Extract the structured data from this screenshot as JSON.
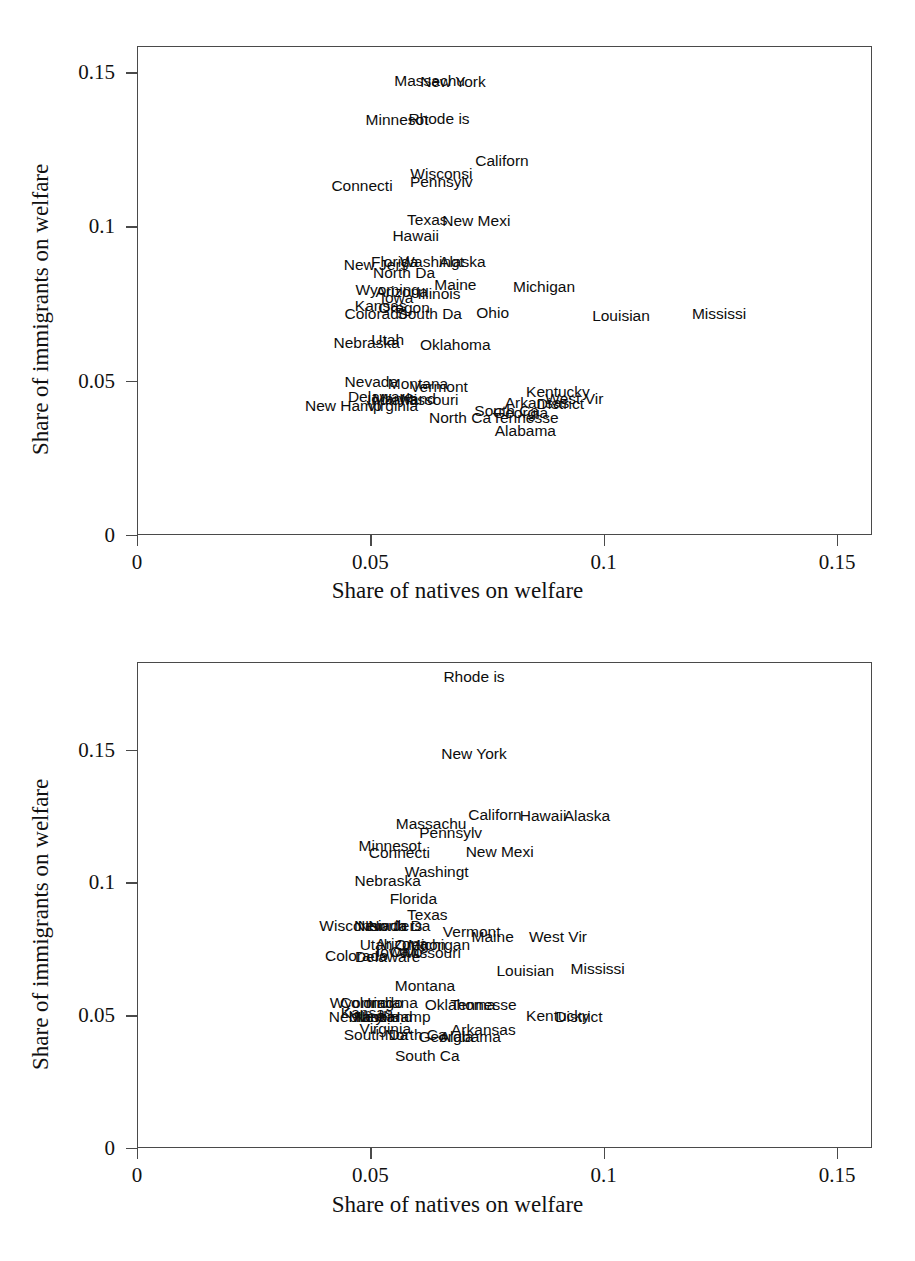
{
  "chart_data": [
    {
      "type": "scatter",
      "id": "chart-top",
      "title": "",
      "xlabel": "Share of natives on welfare",
      "ylabel": "Share of immigrants on welfare",
      "xlim": [
        0,
        0.1575
      ],
      "ylim": [
        0,
        0.1585
      ],
      "xticks": [
        0,
        0.05,
        0.1,
        0.15
      ],
      "xticklabels": [
        "0",
        "0.05",
        "0.1",
        "0.15"
      ],
      "yticks": [
        0,
        0.05,
        0.1,
        0.15
      ],
      "yticklabels": [
        "0",
        "0.05",
        "0.1",
        "0.15"
      ],
      "grid": false,
      "legend": "none",
      "marker": "text-label",
      "points": [
        {
          "label": "Massachu",
          "x": 0.0625,
          "y": 0.1476
        },
        {
          "label": "New York",
          "x": 0.0675,
          "y": 0.147
        },
        {
          "label": "Minnesot",
          "x": 0.0555,
          "y": 0.1347
        },
        {
          "label": "Rhode is",
          "x": 0.0645,
          "y": 0.1353
        },
        {
          "label": "Californ",
          "x": 0.078,
          "y": 0.1216
        },
        {
          "label": "Wisconsi",
          "x": 0.065,
          "y": 0.1172
        },
        {
          "label": "Pennsylv",
          "x": 0.065,
          "y": 0.1147
        },
        {
          "label": "Connecti",
          "x": 0.048,
          "y": 0.1134
        },
        {
          "label": "Texas",
          "x": 0.062,
          "y": 0.1024
        },
        {
          "label": "New Mexi",
          "x": 0.0725,
          "y": 0.1022
        },
        {
          "label": "Hawaii",
          "x": 0.0595,
          "y": 0.0974
        },
        {
          "label": "New Jers",
          "x": 0.051,
          "y": 0.088
        },
        {
          "label": "Florida",
          "x": 0.055,
          "y": 0.0888
        },
        {
          "label": "Washingt",
          "x": 0.063,
          "y": 0.0888
        },
        {
          "label": "Alaska",
          "x": 0.0695,
          "y": 0.0888
        },
        {
          "label": "North Da",
          "x": 0.057,
          "y": 0.0852
        },
        {
          "label": "Maine",
          "x": 0.068,
          "y": 0.0814
        },
        {
          "label": "Michigan",
          "x": 0.087,
          "y": 0.0806
        },
        {
          "label": "Wyoming",
          "x": 0.0535,
          "y": 0.0797
        },
        {
          "label": "Arizona",
          "x": 0.0565,
          "y": 0.079
        },
        {
          "label": "Illinois",
          "x": 0.0645,
          "y": 0.0786
        },
        {
          "label": "Iowa",
          "x": 0.0555,
          "y": 0.0771
        },
        {
          "label": "Kansas",
          "x": 0.052,
          "y": 0.0747
        },
        {
          "label": "Oregon",
          "x": 0.057,
          "y": 0.074
        },
        {
          "label": "Ohio",
          "x": 0.076,
          "y": 0.0724
        },
        {
          "label": "Colorado",
          "x": 0.051,
          "y": 0.072
        },
        {
          "label": "South Da",
          "x": 0.0625,
          "y": 0.0718
        },
        {
          "label": "Louisian",
          "x": 0.1035,
          "y": 0.0714
        },
        {
          "label": "Mississi",
          "x": 0.1245,
          "y": 0.0718
        },
        {
          "label": "Utah",
          "x": 0.0535,
          "y": 0.0634
        },
        {
          "label": "Nebraska",
          "x": 0.049,
          "y": 0.0625
        },
        {
          "label": "Oklahoma",
          "x": 0.068,
          "y": 0.062
        },
        {
          "label": "Nevada",
          "x": 0.05,
          "y": 0.05
        },
        {
          "label": "Montana",
          "x": 0.06,
          "y": 0.0494
        },
        {
          "label": "Vermont",
          "x": 0.0645,
          "y": 0.0482
        },
        {
          "label": "Kentucky",
          "x": 0.09,
          "y": 0.0466
        },
        {
          "label": "Delaware",
          "x": 0.052,
          "y": 0.045
        },
        {
          "label": "Indiana",
          "x": 0.0545,
          "y": 0.044
        },
        {
          "label": "Maryland",
          "x": 0.057,
          "y": 0.0444
        },
        {
          "label": "Missouri",
          "x": 0.0625,
          "y": 0.044
        },
        {
          "label": "West Vir",
          "x": 0.0935,
          "y": 0.0444
        },
        {
          "label": "Arkansas",
          "x": 0.0855,
          "y": 0.043
        },
        {
          "label": "District",
          "x": 0.0905,
          "y": 0.0428
        },
        {
          "label": "Virginia",
          "x": 0.0545,
          "y": 0.0422
        },
        {
          "label": "New Hamp",
          "x": 0.044,
          "y": 0.042
        },
        {
          "label": "South Ca",
          "x": 0.079,
          "y": 0.0404
        },
        {
          "label": "Georgia",
          "x": 0.082,
          "y": 0.04
        },
        {
          "label": "North Ca",
          "x": 0.069,
          "y": 0.0382
        },
        {
          "label": "Tennesse",
          "x": 0.083,
          "y": 0.0382
        },
        {
          "label": "Alabama",
          "x": 0.083,
          "y": 0.034
        }
      ]
    },
    {
      "type": "scatter",
      "id": "chart-bottom",
      "title": "",
      "xlabel": "Share of natives on welfare",
      "ylabel": "Share of immigrants on welfare",
      "xlim": [
        0,
        0.1575
      ],
      "ylim": [
        0,
        0.183
      ],
      "xticks": [
        0,
        0.05,
        0.1,
        0.15
      ],
      "xticklabels": [
        "0",
        "0.05",
        "0.1",
        "0.15"
      ],
      "yticks": [
        0,
        0.05,
        0.1,
        0.15
      ],
      "yticklabels": [
        "0",
        "0.05",
        "0.1",
        "0.15"
      ],
      "grid": false,
      "legend": "none",
      "marker": "text-label",
      "points": [
        {
          "label": "Rhode is",
          "x": 0.072,
          "y": 0.1776
        },
        {
          "label": "New York",
          "x": 0.072,
          "y": 0.1488
        },
        {
          "label": "Californ",
          "x": 0.0765,
          "y": 0.1258
        },
        {
          "label": "Hawaii",
          "x": 0.0868,
          "y": 0.1253
        },
        {
          "label": "Alaska",
          "x": 0.0962,
          "y": 0.1253
        },
        {
          "label": "Massachu",
          "x": 0.0628,
          "y": 0.1225
        },
        {
          "label": "Pennsylv",
          "x": 0.067,
          "y": 0.1188
        },
        {
          "label": "Minnesot",
          "x": 0.054,
          "y": 0.1142
        },
        {
          "label": "Connecti",
          "x": 0.056,
          "y": 0.1115
        },
        {
          "label": "New Mexi",
          "x": 0.0775,
          "y": 0.1118
        },
        {
          "label": "Washingt",
          "x": 0.064,
          "y": 0.1042
        },
        {
          "label": "Nebraska",
          "x": 0.0535,
          "y": 0.101
        },
        {
          "label": "Florida",
          "x": 0.059,
          "y": 0.094
        },
        {
          "label": "Texas",
          "x": 0.062,
          "y": 0.088
        },
        {
          "label": "Wisconsi",
          "x": 0.0455,
          "y": 0.084
        },
        {
          "label": "Nevada",
          "x": 0.052,
          "y": 0.0838
        },
        {
          "label": "New Jers",
          "x": 0.054,
          "y": 0.0838
        },
        {
          "label": "North Da",
          "x": 0.056,
          "y": 0.0838
        },
        {
          "label": "Vermont",
          "x": 0.0715,
          "y": 0.0816
        },
        {
          "label": "Maine",
          "x": 0.076,
          "y": 0.0798
        },
        {
          "label": "West Vir",
          "x": 0.09,
          "y": 0.08
        },
        {
          "label": "Utah",
          "x": 0.051,
          "y": 0.077
        },
        {
          "label": "Arizona",
          "x": 0.0565,
          "y": 0.0772
        },
        {
          "label": "Oregon",
          "x": 0.0605,
          "y": 0.077
        },
        {
          "label": "Michigan",
          "x": 0.0645,
          "y": 0.077
        },
        {
          "label": "Iowa",
          "x": 0.0545,
          "y": 0.074
        },
        {
          "label": "Ohio",
          "x": 0.0575,
          "y": 0.074
        },
        {
          "label": "Missouri",
          "x": 0.063,
          "y": 0.0738
        },
        {
          "label": "Colorado",
          "x": 0.0468,
          "y": 0.0728
        },
        {
          "label": "Delaware",
          "x": 0.0535,
          "y": 0.0722
        },
        {
          "label": "Louisian",
          "x": 0.083,
          "y": 0.0672
        },
        {
          "label": "Mississi",
          "x": 0.0985,
          "y": 0.0676
        },
        {
          "label": "Montana",
          "x": 0.0615,
          "y": 0.0615
        },
        {
          "label": "Wyoming",
          "x": 0.048,
          "y": 0.055
        },
        {
          "label": "Colorado2",
          "x": 0.05,
          "y": 0.055
        },
        {
          "label": "Indiana",
          "x": 0.0545,
          "y": 0.0548
        },
        {
          "label": "Oklahoma",
          "x": 0.069,
          "y": 0.0542
        },
        {
          "label": "Tennesse",
          "x": 0.074,
          "y": 0.0542
        },
        {
          "label": "Kansas",
          "x": 0.049,
          "y": 0.0512
        },
        {
          "label": "Nebraska2",
          "x": 0.048,
          "y": 0.0498
        },
        {
          "label": "Maryland",
          "x": 0.052,
          "y": 0.0498
        },
        {
          "label": "New Hamp",
          "x": 0.0545,
          "y": 0.0498
        },
        {
          "label": "Illinois",
          "x": 0.0512,
          "y": 0.0498
        },
        {
          "label": "Kentucky",
          "x": 0.09,
          "y": 0.05
        },
        {
          "label": "District",
          "x": 0.0945,
          "y": 0.0498
        },
        {
          "label": "Virginia",
          "x": 0.053,
          "y": 0.0452
        },
        {
          "label": "Arkansas",
          "x": 0.074,
          "y": 0.0448
        },
        {
          "label": "South Da",
          "x": 0.051,
          "y": 0.0428
        },
        {
          "label": "North Ca",
          "x": 0.0595,
          "y": 0.0428
        },
        {
          "label": "Georgia",
          "x": 0.066,
          "y": 0.0422
        },
        {
          "label": "Alabama",
          "x": 0.0712,
          "y": 0.0422
        },
        {
          "label": "South Ca",
          "x": 0.062,
          "y": 0.0352
        }
      ]
    }
  ]
}
